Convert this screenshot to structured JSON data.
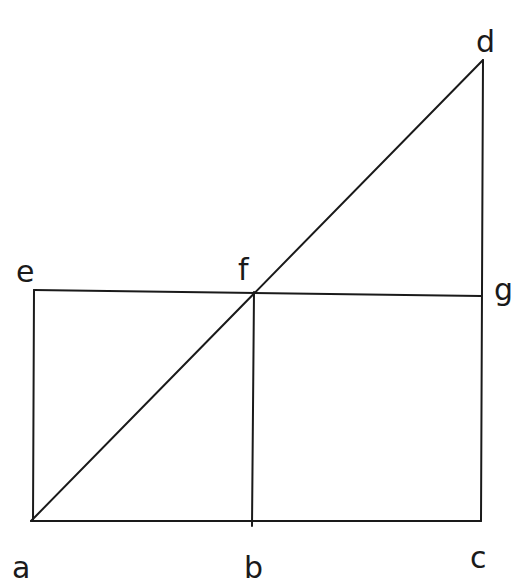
{
  "diagram": {
    "type": "geometric-figure",
    "points": {
      "a": {
        "label": "a",
        "x": 31,
        "y": 521,
        "lx": 12,
        "ly": 580
      },
      "b": {
        "label": "b",
        "x": 252,
        "y": 521,
        "lx": 244,
        "ly": 580
      },
      "c": {
        "label": "c",
        "x": 481,
        "y": 521,
        "lx": 470,
        "ly": 570
      },
      "d": {
        "label": "d",
        "x": 483,
        "y": 60,
        "lx": 478,
        "ly": 52
      },
      "e": {
        "label": "e",
        "x": 34,
        "y": 290,
        "lx": 16,
        "ly": 282
      },
      "f": {
        "label": "f",
        "x": 254,
        "y": 292,
        "lx": 240,
        "ly": 278
      },
      "g": {
        "label": "g",
        "x": 481,
        "y": 296,
        "lx": 494,
        "ly": 302
      }
    },
    "segments": [
      [
        "a",
        "c"
      ],
      [
        "a",
        "e"
      ],
      [
        "e",
        "g"
      ],
      [
        "b",
        "f"
      ],
      [
        "c",
        "d"
      ],
      [
        "a",
        "d"
      ]
    ],
    "stroke_color": "#1a1a1a"
  }
}
